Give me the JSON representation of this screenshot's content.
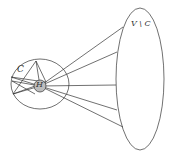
{
  "diagram": {
    "labels": {
      "cluster": "C",
      "hub": "H",
      "complement": "V \\ C"
    },
    "colors": {
      "stroke": "#333333",
      "hub_fill": "#bdbdbd",
      "background": "#ffffff"
    },
    "shapes": {
      "small_ellipse": {
        "cx": 40,
        "cy": 84,
        "rx": 29,
        "ry": 25
      },
      "large_ellipse": {
        "cx": 140,
        "cy": 79,
        "rx": 24,
        "ry": 71
      },
      "hub_circle": {
        "cx": 40,
        "cy": 86,
        "r": 6
      }
    }
  }
}
